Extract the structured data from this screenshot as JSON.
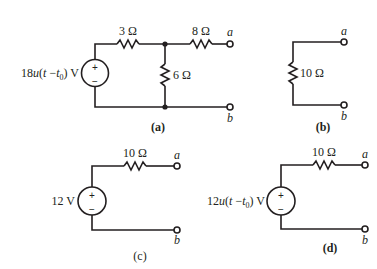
{
  "figure": {
    "colors": {
      "ink": "#231f20",
      "background": "#ffffff"
    },
    "circuits": [
      {
        "id": "a",
        "caption": "(a)",
        "source": {
          "coef": "18",
          "func": "u",
          "arg_open": "(",
          "t": "t",
          "minus": " −",
          "t0": "t",
          "t0_sub": "0",
          "arg_close": ")",
          "unit": " V",
          "plus": "+",
          "minus_sign": "−"
        },
        "resistors": [
          {
            "name": "series-left",
            "label": "3 Ω"
          },
          {
            "name": "shunt",
            "label": "6 Ω"
          },
          {
            "name": "series-right",
            "label": "8 Ω"
          }
        ],
        "terminals": {
          "top": "a",
          "bottom": "b"
        }
      },
      {
        "id": "b",
        "caption": "(b)",
        "resistors": [
          {
            "name": "load",
            "label": "10 Ω"
          }
        ],
        "terminals": {
          "top": "a",
          "bottom": "b"
        }
      },
      {
        "id": "c",
        "caption": "(c)",
        "source": {
          "label": "12 V",
          "plus": "+",
          "minus_sign": "−"
        },
        "resistors": [
          {
            "name": "series",
            "label": "10 Ω"
          }
        ],
        "terminals": {
          "top": "a",
          "bottom": "b"
        }
      },
      {
        "id": "d",
        "caption": "(d)",
        "source": {
          "coef": "12",
          "func": "u",
          "arg_open": "(",
          "t": "t",
          "minus": " −",
          "t0": "t",
          "t0_sub": "0",
          "arg_close": ")",
          "unit": " V",
          "plus": "+",
          "minus_sign": "−"
        },
        "resistors": [
          {
            "name": "series",
            "label": "10 Ω"
          }
        ],
        "terminals": {
          "top": "a",
          "bottom": "b"
        }
      }
    ]
  }
}
